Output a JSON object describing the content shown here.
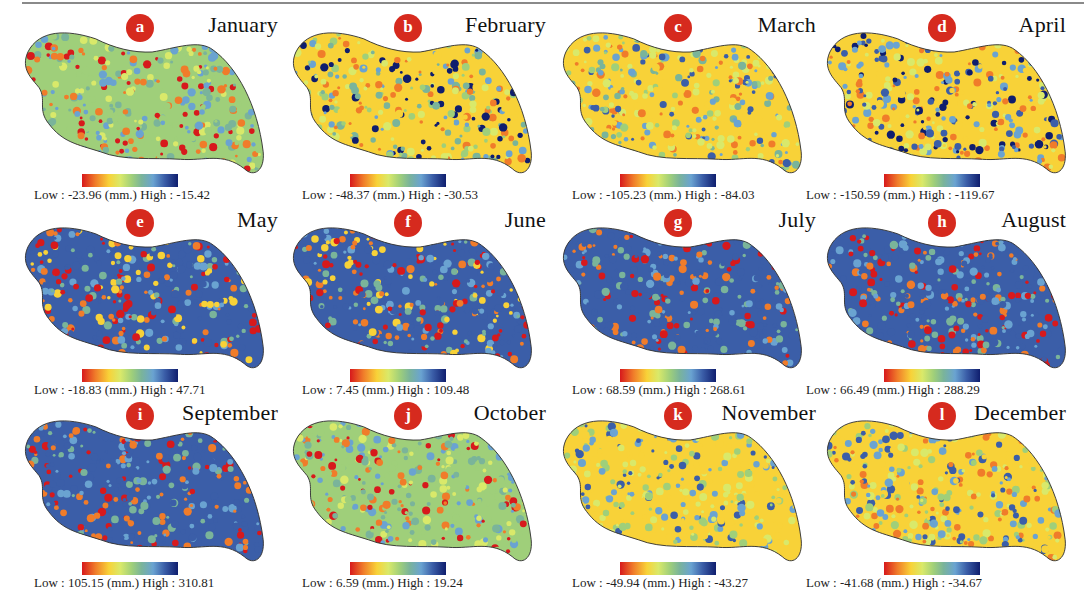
{
  "figure": {
    "unit": "(mm.)",
    "low_prefix": "Low :",
    "high_prefix": "High :",
    "colormap": [
      "#d7191c",
      "#f07c2a",
      "#f8d238",
      "#d9e96a",
      "#9fcf7a",
      "#7ab49a",
      "#6aa3d1",
      "#3b5ea8",
      "#0f1e6e"
    ],
    "badge_color": "#d62a1e",
    "panels": [
      {
        "letter": "a",
        "month": "January",
        "low": "-23.96",
        "high": "-15.42"
      },
      {
        "letter": "b",
        "month": "February",
        "low": "-48.37",
        "high": "-30.53"
      },
      {
        "letter": "c",
        "month": "March",
        "low": "-105.23",
        "high": "-84.03"
      },
      {
        "letter": "d",
        "month": "April",
        "low": "-150.59",
        "high": "-119.67"
      },
      {
        "letter": "e",
        "month": "May",
        "low": "-18.83",
        "high": "47.71"
      },
      {
        "letter": "f",
        "month": "June",
        "low": "7.45",
        "high": "109.48"
      },
      {
        "letter": "g",
        "month": "July",
        "low": "68.59",
        "high": "268.61"
      },
      {
        "letter": "h",
        "month": "August",
        "low": "66.49",
        "high": "288.29"
      },
      {
        "letter": "i",
        "month": "September",
        "low": "105.15",
        "high": "310.81"
      },
      {
        "letter": "j",
        "month": "October",
        "low": "6.59",
        "high": "19.24"
      },
      {
        "letter": "k",
        "month": "November",
        "low": "-49.94",
        "high": "-43.27"
      },
      {
        "letter": "l",
        "month": "December",
        "low": "-41.68",
        "high": "-34.67"
      }
    ]
  }
}
